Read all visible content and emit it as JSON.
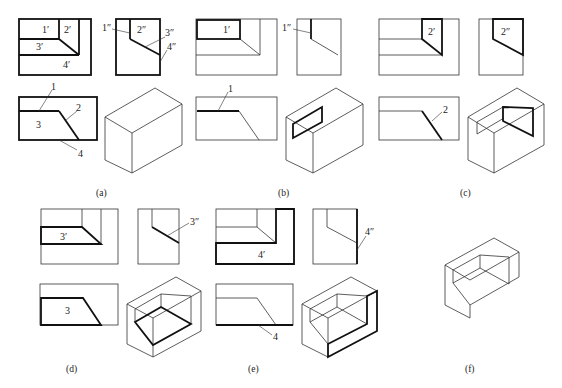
{
  "figure": {
    "panels": [
      {
        "id": "a",
        "caption": "(a)",
        "front_labels": [
          "1′",
          "2′",
          "3′",
          "4′"
        ],
        "side_labels": [
          "1″",
          "2″",
          "3″",
          "4″"
        ],
        "top_labels": [
          "1",
          "2",
          "3",
          "4"
        ]
      },
      {
        "id": "b",
        "caption": "(b)",
        "front_labels": [
          "1′"
        ],
        "side_labels": [
          "1″"
        ],
        "top_labels": [
          "1"
        ]
      },
      {
        "id": "c",
        "caption": "(c)",
        "front_labels": [
          "2′"
        ],
        "side_labels": [
          "2″"
        ],
        "top_labels": [
          "2"
        ]
      },
      {
        "id": "d",
        "caption": "(d)",
        "front_labels": [
          "3′"
        ],
        "side_labels": [
          "3″"
        ],
        "top_labels": [
          "3"
        ]
      },
      {
        "id": "e",
        "caption": "(e)",
        "front_labels": [
          "4′"
        ],
        "side_labels": [
          "4″"
        ],
        "top_labels": [
          "4"
        ]
      },
      {
        "id": "f",
        "caption": "(f)"
      }
    ]
  }
}
